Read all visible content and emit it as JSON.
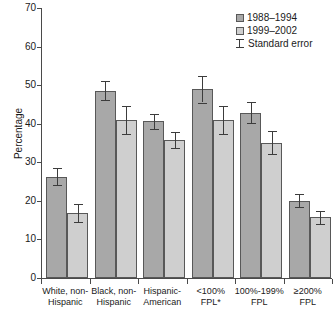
{
  "chart_data": {
    "type": "bar",
    "title": "",
    "subtitle": "",
    "xlabel": "",
    "ylabel": "Percentage",
    "ylim": [
      0,
      70
    ],
    "yticks": [
      0,
      10,
      20,
      30,
      40,
      50,
      60,
      70
    ],
    "grid": false,
    "legend_position": "top-right",
    "categories": [
      "White, non-Hispanic",
      "Black, non-Hispanic",
      "Hispanic-American",
      "<100% FPL*",
      "100%-199% FPL",
      "≥200% FPL"
    ],
    "category_lines": [
      [
        "White, non-",
        "Hispanic"
      ],
      [
        "Black, non-",
        "Hispanic"
      ],
      [
        "Hispanic-",
        "American"
      ],
      [
        "<100%",
        "FPL*"
      ],
      [
        "100%-199%",
        "FPL"
      ],
      [
        "≥200%",
        "FPL"
      ]
    ],
    "series": [
      {
        "name": "1988–1994",
        "color": "#a8a8a8",
        "values": [
          26.3,
          48.6,
          40.6,
          48.9,
          42.9,
          20.0
        ],
        "errors": [
          2.3,
          2.4,
          1.9,
          3.4,
          2.7,
          1.7
        ]
      },
      {
        "name": "1999–2002",
        "color": "#cfcfcf",
        "values": [
          16.9,
          40.9,
          35.7,
          40.9,
          35.1,
          15.7
        ],
        "errors": [
          2.3,
          3.6,
          2.1,
          3.6,
          2.9,
          1.7
        ]
      }
    ],
    "error_legend": "Standard error"
  },
  "legend": {
    "items": [
      {
        "label": "1988–1994",
        "type": "swatch",
        "series": 0
      },
      {
        "label": "1999–2002",
        "type": "swatch",
        "series": 1
      },
      {
        "label": "Standard error",
        "type": "errorbar"
      }
    ]
  },
  "axes": {
    "y_title": "Percentage"
  }
}
